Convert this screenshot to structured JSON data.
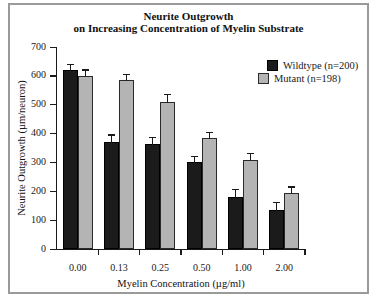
{
  "chart_data": {
    "type": "bar",
    "title_lines": [
      "Neurite Outgrowth",
      "on Increasing Concentration of Myelin Substrate"
    ],
    "categories": [
      "0.00",
      "0.13",
      "0.25",
      "0.50",
      "1.00",
      "2.00"
    ],
    "series": [
      {
        "name": "Wildtype (n=200)",
        "color": "#1b1b1b",
        "border_color": "#000000",
        "values": [
          620,
          370,
          365,
          300,
          180,
          135
        ],
        "errors": [
          20,
          25,
          20,
          20,
          25,
          25
        ]
      },
      {
        "name": "Mutant (n=198)",
        "color": "#b4b4b4",
        "border_color": "#2a2a2a",
        "values": [
          600,
          585,
          510,
          385,
          310,
          195
        ],
        "errors": [
          20,
          20,
          25,
          20,
          20,
          20
        ]
      }
    ],
    "xlabel": "Myelin Concentration (µg/ml)",
    "ylabel": "Neurite Outgrowth (µm/neuron)",
    "ylim": [
      0,
      700
    ],
    "ytick_step": 100,
    "ytick_labels": [
      "0",
      "100",
      "200",
      "300",
      "400",
      "500",
      "600",
      "700"
    ],
    "legend_position": "top-right",
    "grid": false,
    "error_bars": "upper caps",
    "axis_color": "#1a1a1a",
    "panel_border_color": "#9a9a9a"
  }
}
